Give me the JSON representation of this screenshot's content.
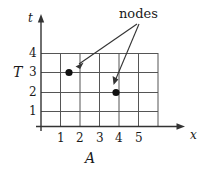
{
  "figure": {
    "type": "grid-diagram",
    "background_color": "#ffffff",
    "ink_color": "#1a1a1a",
    "grid_color": "#555555"
  },
  "axes": {
    "vertical": {
      "label": "t",
      "secondary_label": "T",
      "tick_labels": [
        "1",
        "2",
        "3",
        "4"
      ],
      "tick_values": [
        1,
        2,
        3,
        4
      ],
      "arrow": "up"
    },
    "horizontal": {
      "label": "x",
      "secondary_label": "A",
      "tick_labels": [
        "1",
        "2",
        "3",
        "4",
        "5"
      ],
      "tick_values": [
        1,
        2,
        3,
        4,
        5
      ],
      "arrow": "right"
    }
  },
  "grid": {
    "columns": 6,
    "rows": 4,
    "left": 41,
    "right": 158,
    "top": 53,
    "bottom": 126,
    "cell_width": 19.5,
    "row_lines_y": [
      53,
      72,
      92,
      111,
      126
    ]
  },
  "annotation": {
    "label": "nodes",
    "arrow_count": 2,
    "origin": {
      "x": 137,
      "y": 23
    }
  },
  "nodes": [
    {
      "name": "node-1",
      "x": 2,
      "t": 3,
      "px": 69,
      "py": 72
    },
    {
      "name": "node-2",
      "x": 4,
      "t": 2,
      "px": 116,
      "py": 92
    }
  ]
}
